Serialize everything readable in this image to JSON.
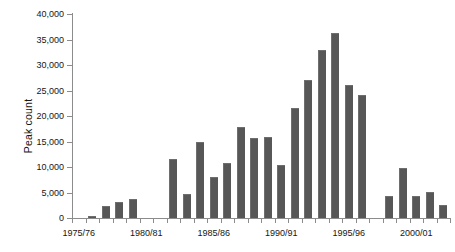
{
  "chart_data": {
    "type": "bar",
    "title": "",
    "xlabel": "",
    "ylabel": "Peak count",
    "ylim": [
      0,
      40000
    ],
    "ytick_values": [
      0,
      5000,
      10000,
      15000,
      20000,
      25000,
      30000,
      35000,
      40000
    ],
    "ytick_labels": [
      "0",
      "5,000",
      "10,000",
      "15,000",
      "20,000",
      "25,000",
      "30,000",
      "35,000",
      "40,000"
    ],
    "grid": false,
    "legend": null,
    "bar_color": "#575757",
    "axis_color": "#8c8c8c",
    "categories": [
      "1975/76",
      "1976/77",
      "1977/78",
      "1978/79",
      "1979/80",
      "1980/81",
      "1981/82",
      "1982/83",
      "1983/84",
      "1984/85",
      "1985/86",
      "1986/87",
      "1987/88",
      "1988/89",
      "1989/90",
      "1990/91",
      "1991/92",
      "1992/93",
      "1993/94",
      "1994/95",
      "1995/96",
      "1996/97",
      "1997/98",
      "1998/99",
      "1999/00",
      "2000/01",
      "2001/02",
      "2002/03"
    ],
    "values": [
      0,
      300,
      2400,
      3200,
      3800,
      0,
      0,
      11600,
      4800,
      14900,
      8100,
      10700,
      17900,
      15700,
      15900,
      10400,
      21500,
      27100,
      33000,
      36300,
      26100,
      24200,
      0,
      4300,
      9900,
      4400,
      5100,
      2500
    ],
    "xtick_labels": [
      "1975/76",
      "1980/81",
      "1985/86",
      "1990/91",
      "1995/96",
      "2000/01"
    ],
    "xtick_categories": [
      "1975/76",
      "1980/81",
      "1985/86",
      "1990/91",
      "1995/96",
      "2000/01"
    ]
  }
}
